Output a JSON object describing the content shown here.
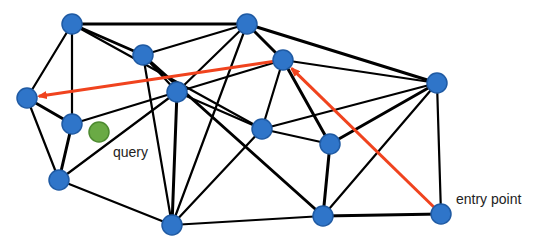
{
  "diagram": {
    "type": "graph-search-illustration",
    "colors": {
      "node_fill": "#2f75c9",
      "node_stroke": "#1f5aa3",
      "edge": "#000000",
      "path": "#f0431e",
      "query_fill": "#6aaa45",
      "query_stroke": "#4d8a30",
      "text": "#222222"
    },
    "nodes": [
      {
        "id": "A",
        "x": 72,
        "y": 24
      },
      {
        "id": "B",
        "x": 247,
        "y": 24
      },
      {
        "id": "C",
        "x": 143,
        "y": 55
      },
      {
        "id": "D",
        "x": 283,
        "y": 60
      },
      {
        "id": "E",
        "x": 437,
        "y": 83
      },
      {
        "id": "F",
        "x": 27,
        "y": 98
      },
      {
        "id": "G",
        "x": 177,
        "y": 92
      },
      {
        "id": "H",
        "x": 72,
        "y": 124
      },
      {
        "id": "I",
        "x": 262,
        "y": 129
      },
      {
        "id": "J",
        "x": 330,
        "y": 144
      },
      {
        "id": "K",
        "x": 59,
        "y": 180
      },
      {
        "id": "L",
        "x": 172,
        "y": 225
      },
      {
        "id": "M",
        "x": 323,
        "y": 216
      },
      {
        "id": "N",
        "x": 441,
        "y": 214
      }
    ],
    "edges": [
      [
        "A",
        "B"
      ],
      [
        "A",
        "F"
      ],
      [
        "A",
        "H"
      ],
      [
        "A",
        "C"
      ],
      [
        "A",
        "I"
      ],
      [
        "B",
        "C"
      ],
      [
        "B",
        "D"
      ],
      [
        "B",
        "G"
      ],
      [
        "B",
        "L"
      ],
      [
        "B",
        "E"
      ],
      [
        "C",
        "G"
      ],
      [
        "C",
        "L"
      ],
      [
        "C",
        "M"
      ],
      [
        "D",
        "E"
      ],
      [
        "D",
        "I"
      ],
      [
        "D",
        "J"
      ],
      [
        "D",
        "G"
      ],
      [
        "E",
        "I"
      ],
      [
        "E",
        "J"
      ],
      [
        "E",
        "M"
      ],
      [
        "E",
        "N"
      ],
      [
        "F",
        "H"
      ],
      [
        "F",
        "K"
      ],
      [
        "G",
        "H"
      ],
      [
        "G",
        "L"
      ],
      [
        "G",
        "K"
      ],
      [
        "G",
        "I"
      ],
      [
        "H",
        "K"
      ],
      [
        "I",
        "J"
      ],
      [
        "I",
        "L"
      ],
      [
        "J",
        "M"
      ],
      [
        "K",
        "L"
      ],
      [
        "L",
        "M"
      ],
      [
        "M",
        "N"
      ]
    ],
    "search_path": [
      {
        "from": "N",
        "to": "D"
      },
      {
        "from": "D",
        "to": "F"
      }
    ],
    "query_point": {
      "x": 99,
      "y": 132,
      "label": "query"
    },
    "entry_label": "entry point"
  }
}
